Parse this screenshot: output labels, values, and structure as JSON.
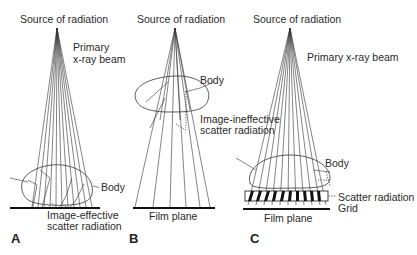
{
  "figure": {
    "panels": [
      {
        "id": "A",
        "label": "A",
        "source_label": "Source of radiation",
        "beam_label_line1": "Primary",
        "beam_label_line2": "x-ray beam",
        "body_label": "Body",
        "scatter_label_line1": "Image-effective",
        "scatter_label_line2": "scatter radiation"
      },
      {
        "id": "B",
        "label": "B",
        "source_label": "Source of radiation",
        "body_label": "Body",
        "scatter_label_line1": "Image-ineffective",
        "scatter_label_line2": "scatter radiation",
        "film_label": "Film plane"
      },
      {
        "id": "C",
        "label": "C",
        "source_label": "Source of radiation",
        "beam_label": "Primary x-ray beam",
        "body_label": "Body",
        "scatter_label": "Scatter radiation",
        "grid_label": "Grid",
        "film_label": "Film plane"
      }
    ]
  }
}
